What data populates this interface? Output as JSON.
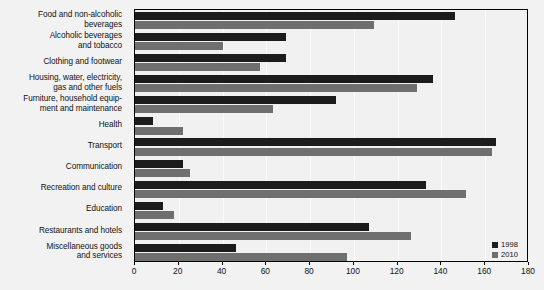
{
  "chart_data": {
    "type": "bar",
    "orientation": "horizontal",
    "title": "",
    "subtitle": "",
    "xlabel": "",
    "ylabel": "",
    "xlim": [
      0,
      180
    ],
    "xticks": [
      0,
      20,
      40,
      60,
      80,
      100,
      120,
      140,
      160,
      180
    ],
    "grid": true,
    "legend_position": "bottom-right",
    "categories": [
      "Food and non-alcoholic\nbeverages",
      "Alcoholic beverages\nand tobacco",
      "Clothing and footwear",
      "Housing, water, electricity,\ngas and other fuels",
      "Furniture, household equip-\nment and maintenance",
      "Health",
      "Transport",
      "Communication",
      "Recreation and culture",
      "Education",
      "Restaurants and hotels",
      "Miscellaneous goods\nand services"
    ],
    "series": [
      {
        "name": "1998",
        "color": "#1c1c1c",
        "values": [
          146,
          69,
          69,
          136,
          92,
          8,
          165,
          22,
          133,
          13,
          107,
          46
        ]
      },
      {
        "name": "2010",
        "color": "#6f6f6f",
        "values": [
          109,
          40,
          57,
          129,
          63,
          22,
          163,
          25,
          151,
          18,
          126,
          97
        ]
      }
    ]
  },
  "colors": {
    "background": "#f2f2f2",
    "plot_background": "#f1f1f1",
    "axis": "#000000",
    "series_1998": "#1c1c1c",
    "series_2010": "#6f6f6f",
    "gridline": "#fbfbfb",
    "text": "#111111"
  }
}
